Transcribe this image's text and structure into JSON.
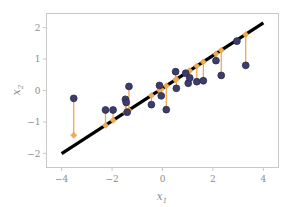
{
  "chart_data": {
    "type": "scatter",
    "title": "",
    "xlabel": "x₁",
    "ylabel": "x₂",
    "xlabel_base": "x",
    "xlabel_sub": "1",
    "ylabel_base": "x",
    "ylabel_sub": "2",
    "xlim": [
      -4.6,
      4.6
    ],
    "ylim": [
      -2.45,
      2.45
    ],
    "xticks": [
      -4,
      -2,
      0,
      2,
      4
    ],
    "xtick_labels": [
      "−4",
      "−2",
      "0",
      "2",
      "4"
    ],
    "yticks": [
      -2,
      -1,
      0,
      1,
      2
    ],
    "ytick_labels": [
      "−2",
      "−1",
      "0",
      "1",
      "2"
    ],
    "grid": false,
    "legend": "none",
    "colors": {
      "point_fill": "#3d3d6b",
      "point_edge": "#2a2a4d",
      "residual": "#f0a94e",
      "fit_line": "#000000",
      "spine": "#c8c8c8",
      "tick_text": "#8c8c8c",
      "background": "#ffffff"
    },
    "fit_line": {
      "name": "regression line",
      "slope": 0.52,
      "intercept": 0.07,
      "x_start": -4.0,
      "x_end": 4.0,
      "y_start": -2.01,
      "y_end": 2.15,
      "width": 3.2
    },
    "series": [
      {
        "name": "observations",
        "marker": "circle",
        "points": [
          {
            "x": -3.52,
            "y": -0.25,
            "fit_y": -1.42
          },
          {
            "x": -2.26,
            "y": -0.62,
            "fit_y": -1.11
          },
          {
            "x": -1.96,
            "y": -0.62,
            "fit_y": -0.95
          },
          {
            "x": -1.47,
            "y": -0.28,
            "fit_y": -0.7
          },
          {
            "x": -1.44,
            "y": -0.38,
            "fit_y": -0.69
          },
          {
            "x": -1.4,
            "y": -0.69,
            "fit_y": -0.67
          },
          {
            "x": -1.33,
            "y": 0.13,
            "fit_y": -0.63
          },
          {
            "x": -0.44,
            "y": -0.45,
            "fit_y": -0.16
          },
          {
            "x": -0.12,
            "y": 0.16,
            "fit_y": 0.01
          },
          {
            "x": -0.05,
            "y": -0.17,
            "fit_y": 0.04
          },
          {
            "x": 0.15,
            "y": -0.61,
            "fit_y": 0.15
          },
          {
            "x": 0.52,
            "y": 0.6,
            "fit_y": 0.34
          },
          {
            "x": 0.55,
            "y": 0.07,
            "fit_y": 0.36
          },
          {
            "x": 0.92,
            "y": 0.55,
            "fit_y": 0.55
          },
          {
            "x": 1.02,
            "y": 0.23,
            "fit_y": 0.6
          },
          {
            "x": 1.08,
            "y": 0.4,
            "fit_y": 0.63
          },
          {
            "x": 1.36,
            "y": 0.28,
            "fit_y": 0.78
          },
          {
            "x": 1.62,
            "y": 0.31,
            "fit_y": 0.91
          },
          {
            "x": 2.12,
            "y": 0.95,
            "fit_y": 1.17
          },
          {
            "x": 2.33,
            "y": 0.48,
            "fit_y": 1.28
          },
          {
            "x": 2.95,
            "y": 1.57,
            "fit_y": 1.6
          },
          {
            "x": 3.3,
            "y": 0.8,
            "fit_y": 1.78
          }
        ]
      }
    ],
    "residual_lines": {
      "name": "residual segments",
      "description": "orange vertical segments connecting each observation to its fitted value on the regression line",
      "marker": "diamond-on-line",
      "count": 22
    }
  }
}
